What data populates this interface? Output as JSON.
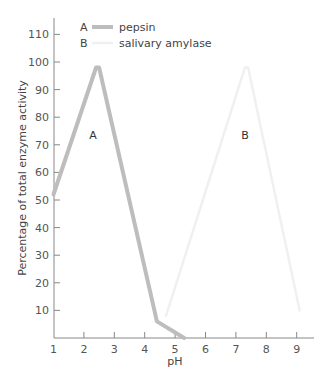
{
  "chart_data": {
    "type": "line",
    "title": "",
    "xlabel": "pH",
    "ylabel": "Percentage of total enzyme activity",
    "xlim": [
      1,
      9.3
    ],
    "ylim": [
      0,
      115
    ],
    "x_ticks": [
      1,
      2,
      3,
      4,
      5,
      6,
      7,
      8,
      9
    ],
    "y_ticks": [
      10,
      20,
      30,
      40,
      50,
      60,
      70,
      80,
      90,
      100,
      110
    ],
    "grid": false,
    "legend_position": "top-left inside",
    "legend": [
      {
        "key": "A",
        "label": "pepsin",
        "color": "#bdbdbd"
      },
      {
        "key": "B",
        "label": "salivary amylase",
        "color": "#f0f0f0"
      }
    ],
    "series": [
      {
        "name": "pepsin",
        "key": "A",
        "color": "#bdbdbd",
        "x": [
          1.0,
          2.4,
          2.5,
          4.4,
          5.3
        ],
        "y": [
          52,
          98,
          98,
          6,
          0
        ]
      },
      {
        "name": "salivary amylase",
        "key": "B",
        "color": "#f0f0f0",
        "x": [
          4.7,
          7.3,
          7.4,
          9.1
        ],
        "y": [
          8,
          98,
          98,
          10
        ]
      }
    ],
    "annotations": [
      {
        "text": "A",
        "x": 2.3,
        "y": 72
      },
      {
        "text": "B",
        "x": 7.3,
        "y": 72
      }
    ]
  }
}
